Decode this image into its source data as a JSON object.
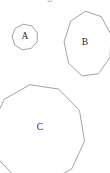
{
  "figure": {
    "background_color": "#ffffff",
    "stroke_color": "#8a8a8a",
    "label_color": "#2b2b2b",
    "width": 110,
    "height": 173,
    "top_clipped_fragment": "g",
    "shapes": [
      {
        "id": "A",
        "label": "A",
        "kind": "polygon",
        "sides": 9,
        "center_x": 25,
        "center_y": 37,
        "radius_x": 13,
        "radius_y": 13,
        "rotation_deg": -8,
        "label_x": 25,
        "label_y": 37,
        "clipped": false
      },
      {
        "id": "B",
        "label": "B",
        "kind": "polygon",
        "sides": 9,
        "center_x": 88,
        "center_y": 44,
        "radius_x": 24,
        "radius_y": 33,
        "rotation_deg": -6,
        "label_x": 85,
        "label_y": 43,
        "clipped": true
      },
      {
        "id": "C",
        "label": "C",
        "kind": "polygon",
        "sides": 10,
        "center_x": 38,
        "center_y": 134,
        "radius_x": 47,
        "radius_y": 50,
        "rotation_deg": -10,
        "label_x": 40,
        "label_y": 128,
        "clipped": true
      }
    ]
  }
}
